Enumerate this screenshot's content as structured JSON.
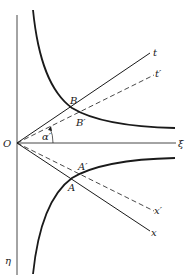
{
  "diagram": {
    "type": "spacetime-hyperbola-diagram",
    "colors": {
      "ink": "#1a1a1a",
      "background": "#ffffff"
    },
    "axes": {
      "horizontal": {
        "label": "ξ"
      },
      "vertical": {
        "label": "η"
      },
      "origin": {
        "label": "O"
      }
    },
    "lines": {
      "t": {
        "label": "t",
        "style": "solid"
      },
      "t_prime": {
        "label": "t′",
        "style": "dashed"
      },
      "x": {
        "label": "x",
        "style": "solid"
      },
      "x_prime": {
        "label": "x′",
        "style": "dashed"
      }
    },
    "points": {
      "B": {
        "label": "B"
      },
      "B_prime": {
        "label": "B′"
      },
      "A": {
        "label": "A"
      },
      "A_prime": {
        "label": "A′"
      }
    },
    "angle": {
      "label": "α′"
    },
    "curves": {
      "upper_hyperbola": {
        "style": "solid-thick"
      },
      "lower_hyperbola": {
        "style": "solid-thick"
      }
    }
  }
}
